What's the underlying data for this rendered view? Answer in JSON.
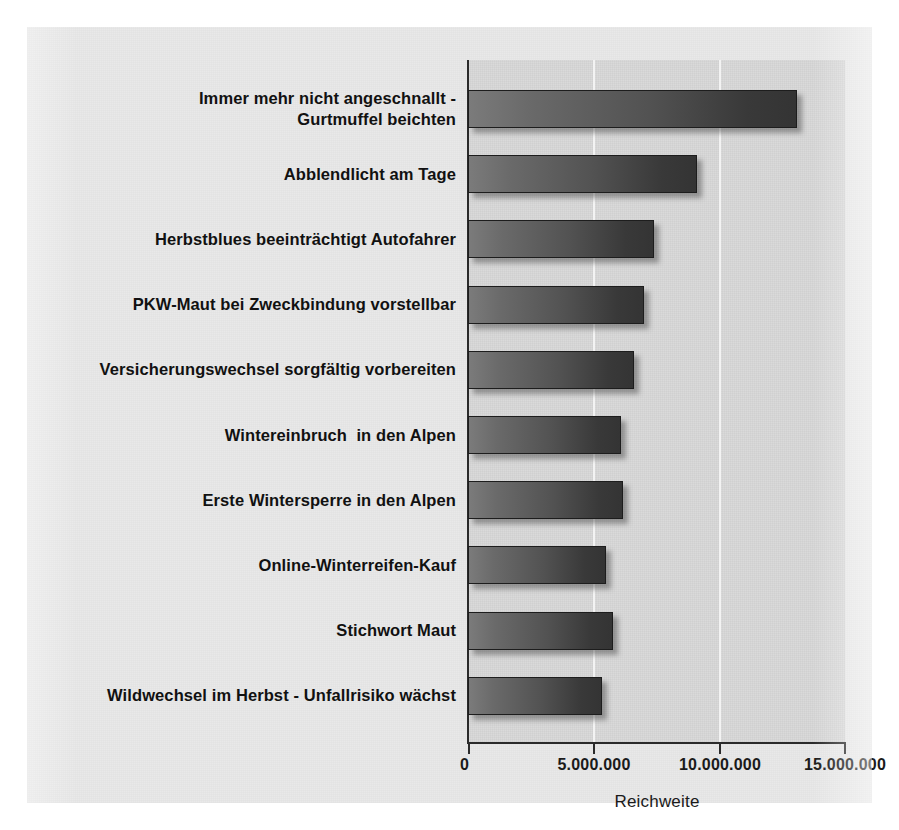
{
  "chart_data": {
    "type": "bar",
    "orientation": "horizontal",
    "title": "",
    "xlabel": "Reichweite",
    "ylabel": "",
    "xlim": [
      0,
      15000000
    ],
    "grid": true,
    "legend": false,
    "tick_labels": [
      "0",
      "5.000.000",
      "10.000.000",
      "15.000.000"
    ],
    "tick_values": [
      0,
      5000000,
      10000000,
      15000000
    ],
    "categories": [
      "Immer mehr nicht angeschnallt -\nGurtmuffel beichten",
      "Abblendlicht am Tage",
      "Herbstblues beeinträchtigt Autofahrer",
      "PKW-Maut bei Zweckbindung vorstellbar",
      "Versicherungswechsel sorgfältig vorbereiten",
      "Wintereinbruch  in den Alpen",
      "Erste Wintersperre in den Alpen",
      "Online-Winterreifen-Kauf",
      "Stichwort Maut",
      "Wildwechsel im Herbst - Unfallrisiko wächst"
    ],
    "values": [
      13100000,
      9100000,
      7400000,
      7000000,
      6600000,
      6100000,
      6150000,
      5500000,
      5750000,
      5350000
    ],
    "series": [
      {
        "name": "Reichweite",
        "values": [
          13100000,
          9100000,
          7400000,
          7000000,
          6600000,
          6100000,
          6150000,
          5500000,
          5750000,
          5350000
        ]
      }
    ],
    "colors": {
      "bar_light": "#7b7b7b",
      "bar_dark": "#343434",
      "bar_border": "#1d1d1d",
      "plot_background": "#d8d8d8",
      "figure_background": "#e9e9e9",
      "gridline": "#f3f3f3",
      "axis": "#2b2b2b",
      "text": "#111111"
    }
  }
}
